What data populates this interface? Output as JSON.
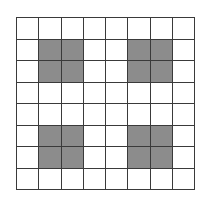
{
  "grid": {
    "rows": 8,
    "cols": 8,
    "fill_color": "#8c8c8c",
    "empty_color": "#ffffff",
    "line_color": "#3a3a3a",
    "cells": [
      [
        0,
        0,
        0,
        0,
        0,
        0,
        0,
        0
      ],
      [
        0,
        1,
        1,
        0,
        0,
        1,
        1,
        0
      ],
      [
        0,
        1,
        1,
        0,
        0,
        1,
        1,
        0
      ],
      [
        0,
        0,
        0,
        0,
        0,
        0,
        0,
        0
      ],
      [
        0,
        0,
        0,
        0,
        0,
        0,
        0,
        0
      ],
      [
        0,
        1,
        1,
        0,
        0,
        1,
        1,
        0
      ],
      [
        0,
        1,
        1,
        0,
        0,
        1,
        1,
        0
      ],
      [
        0,
        0,
        0,
        0,
        0,
        0,
        0,
        0
      ]
    ]
  }
}
